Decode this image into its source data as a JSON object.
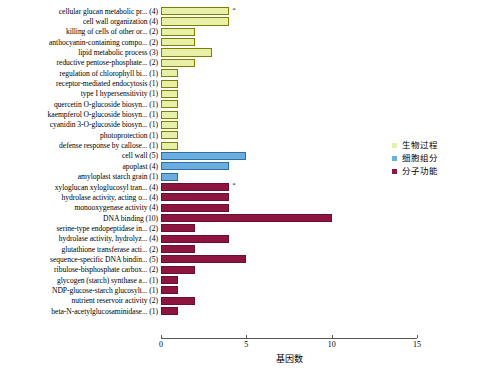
{
  "chart_data": {
    "type": "bar",
    "orientation": "horizontal",
    "title": "",
    "xlabel": "基因数",
    "ylabel": "",
    "xlim": [
      0,
      15
    ],
    "xticks": [
      0,
      5,
      10,
      15
    ],
    "grid": false,
    "legend_position": "right",
    "legend": [
      {
        "name": "生物过程",
        "color": "#e8f0a8",
        "key": "bp"
      },
      {
        "name": "细胞组分",
        "color": "#6aaee0",
        "key": "cc"
      },
      {
        "name": "分子功能",
        "color": "#8e1540",
        "key": "mf"
      }
    ],
    "categories": [
      "cellular glucan metabolic pr... (4)",
      "cell wall organization (4)",
      "killing of cells of other or... (2)",
      "anthocyanin-containing compo... (2)",
      "lipid metabolic process (3)",
      "reductive pentose-phosphate... (2)",
      "regulation of chlorophyll bi... (1)",
      "receptor-mediated endocytosis (1)",
      "type I hypersensitivity (1)",
      "quercetin O-glucoside biosyn... (1)",
      "kaempferol O-glucoside biosyn... (1)",
      "cyanidin 3-O-glucoside biosyn... (1)",
      "photoprotection (1)",
      "defense response by callose... (1)",
      "cell wall (5)",
      "apoplast (4)",
      "amyloplast starch grain (1)",
      "xyloglucan xyloglucosyl tran... (4)",
      "hydrolase activity, acting o... (4)",
      "monooxygenase activity (4)",
      "DNA binding (10)",
      "serine-type endopeptidase in... (2)",
      "hydrolase activity, hydrolyz... (4)",
      "glutathione transferase acti... (2)",
      "sequence-specific DNA bindin... (5)",
      "ribulose-bisphosphate carbox... (2)",
      "glycogen (starch) synthase a... (1)",
      "NDP-glucose-starch glucosylt... (1)",
      "nutrient reservoir activity (2)",
      "beta-N-acetylglucosaminidase... (1)"
    ],
    "values": [
      4,
      4,
      2,
      2,
      3,
      2,
      1,
      1,
      1,
      1,
      1,
      1,
      1,
      1,
      5,
      4,
      1,
      4,
      4,
      4,
      10,
      2,
      4,
      2,
      5,
      2,
      1,
      1,
      2,
      1
    ],
    "groups": [
      "bp",
      "bp",
      "bp",
      "bp",
      "bp",
      "bp",
      "bp",
      "bp",
      "bp",
      "bp",
      "bp",
      "bp",
      "bp",
      "bp",
      "cc",
      "cc",
      "cc",
      "mf",
      "mf",
      "mf",
      "mf",
      "mf",
      "mf",
      "mf",
      "mf",
      "mf",
      "mf",
      "mf",
      "mf",
      "mf"
    ],
    "annotations": [
      {
        "category_index": 0,
        "marker": "*"
      },
      {
        "category_index": 17,
        "marker": "*"
      }
    ]
  }
}
